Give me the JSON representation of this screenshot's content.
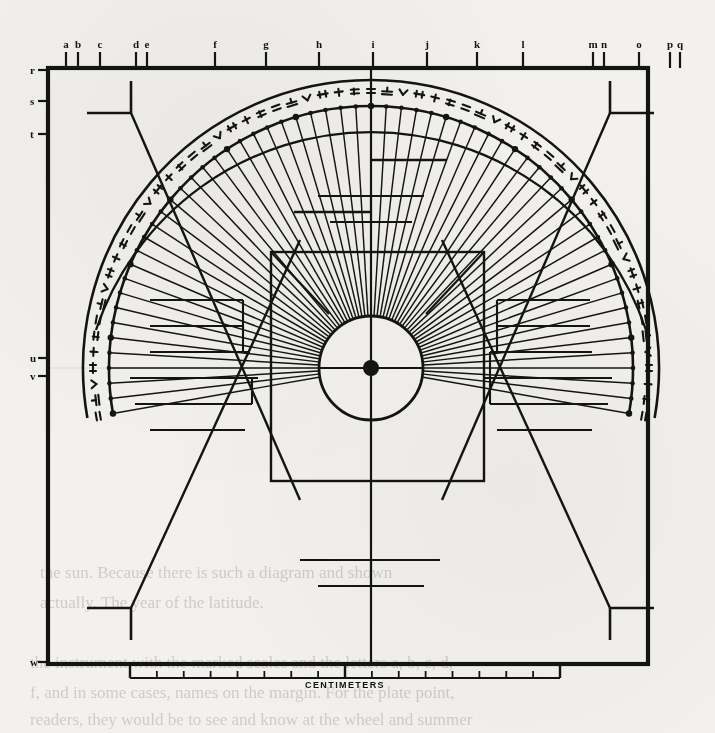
{
  "page": {
    "background_color": "#f2f1ee",
    "ink_color": "#141414",
    "width": 715,
    "height": 733
  },
  "figure": {
    "name": "astrolabe-alidade-rete-scale-diagram",
    "caption_scale": "CENTIMETERS",
    "frame": {
      "x": 48,
      "y": 68,
      "width": 600,
      "height": 596
    },
    "center": {
      "x": 371,
      "y": 368
    },
    "inner_circle_radius": 52,
    "center_dot_radius": 8,
    "inner_square": {
      "x": 271,
      "y": 252,
      "width": 213,
      "height": 229
    },
    "outer_arc_radius": 288,
    "inner_arc_radius": 262,
    "arc_start_deg": 170,
    "arc_end_deg": 370,
    "radial_line_count": 61,
    "arc_tick_count": 61
  },
  "top_labels": [
    {
      "text": "a",
      "x": 66
    },
    {
      "text": "b",
      "x": 78
    },
    {
      "text": "c",
      "x": 100
    },
    {
      "text": "d",
      "x": 136
    },
    {
      "text": "e",
      "x": 147
    },
    {
      "text": "f",
      "x": 215
    },
    {
      "text": "g",
      "x": 266
    },
    {
      "text": "h",
      "x": 319
    },
    {
      "text": "i",
      "x": 373
    },
    {
      "text": "j",
      "x": 427
    },
    {
      "text": "k",
      "x": 477
    },
    {
      "text": "l",
      "x": 523
    },
    {
      "text": "m",
      "x": 593
    },
    {
      "text": "n",
      "x": 604
    },
    {
      "text": "o",
      "x": 639
    },
    {
      "text": "p",
      "x": 670
    },
    {
      "text": "q",
      "x": 680
    }
  ],
  "side_labels": [
    {
      "text": "r",
      "y": 70
    },
    {
      "text": "s",
      "y": 101
    },
    {
      "text": "t",
      "y": 134
    },
    {
      "text": "u",
      "y": 358
    },
    {
      "text": "v",
      "y": 376
    },
    {
      "text": "w",
      "y": 662
    }
  ],
  "ruler": {
    "label": "CENTIMETERS",
    "x_start": 130,
    "x_end": 560,
    "y": 678,
    "major_tick_count": 2,
    "minor_tick_count": 14
  },
  "arc_symbols_note": "abjad numeral glyph series engraved around the limb",
  "bleed_text": [
    {
      "text": "the sun. Because there is such a diagram and shown",
      "x": 40,
      "y": 558
    },
    {
      "text": "actually. The year of the latitude.",
      "x": 40,
      "y": 588
    },
    {
      "text": "the instrument with the marked scales and the letters a, b, c, d,",
      "x": 30,
      "y": 648
    },
    {
      "text": "f, and in some cases, names on the margin. For the plate point,",
      "x": 30,
      "y": 678
    },
    {
      "text": "readers, they would be to see and know at the wheel and summer",
      "x": 30,
      "y": 705
    }
  ]
}
